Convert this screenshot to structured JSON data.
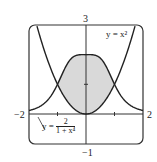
{
  "chart_data": {
    "type": "line",
    "title": "",
    "xlabel": "",
    "ylabel": "",
    "xlim": [
      -2,
      2
    ],
    "ylim": [
      -1,
      3
    ],
    "tick_labels": {
      "x_min": "−2",
      "x_max": "2",
      "y_max": "3",
      "y_min": "−1"
    },
    "series": [
      {
        "name": "y = x^2",
        "expression": "x^2",
        "label": "y = x²"
      },
      {
        "name": "y = 2/(1+x^4)",
        "expression": "2/(1+x^4)",
        "label_lhs": "y =",
        "label_num": "2",
        "label_den": "1 + x⁴"
      }
    ],
    "shaded_region": {
      "between": [
        "2/(1+x^4)",
        "x^2"
      ],
      "x_range": [
        -1,
        1
      ],
      "color": "#d8d8d8"
    },
    "grid": false
  },
  "labels": {
    "x_min": "−2",
    "x_max": "2",
    "y_max": "3",
    "y_min": "−1",
    "curve1": "y = x²",
    "curve2_lhs": "y =",
    "curve2_num": "2",
    "curve2_den": "1 + x⁴"
  }
}
